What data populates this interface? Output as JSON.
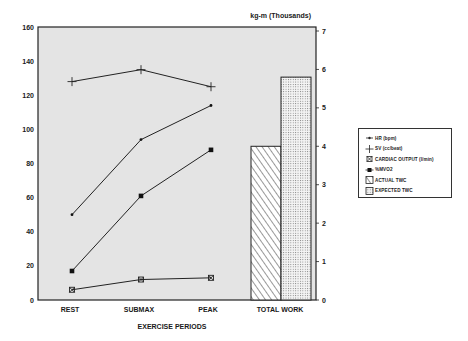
{
  "chart_data": {
    "type": "line",
    "title": "",
    "xlabel": "EXERCISE PERIODS",
    "ylabel": "",
    "y2label": "kg-m (Thousands)",
    "categories": [
      "REST",
      "SUBMAX",
      "PEAK"
    ],
    "ylim": [
      0,
      160
    ],
    "yticks": [
      0,
      20,
      40,
      60,
      80,
      100,
      120,
      140,
      160
    ],
    "y2lim": [
      0,
      7
    ],
    "y2ticks": [
      0,
      1,
      2,
      3,
      4,
      5,
      6,
      7
    ],
    "grid": false,
    "background": "#e4e4e4",
    "legend_position": "right",
    "series": [
      {
        "name": "HR (bpm)",
        "marker": "dot",
        "axis": "left",
        "values": [
          50,
          94,
          114
        ]
      },
      {
        "name": "SV (cc/beat)",
        "marker": "plus",
        "axis": "left",
        "values": [
          128,
          135,
          125
        ]
      },
      {
        "name": "CARDIAC OUTPUT (l/min)",
        "marker": "asterisk-box",
        "axis": "left",
        "values": [
          6,
          12,
          13
        ]
      },
      {
        "name": "%MVO2",
        "marker": "square",
        "axis": "left",
        "values": [
          17,
          61,
          88
        ]
      }
    ],
    "bars": {
      "category": "TOTAL WORK",
      "axis": "right",
      "series": [
        {
          "name": "ACTUAL TWC",
          "pattern": "diagonal-hatch",
          "value": 4.0
        },
        {
          "name": "EXPECTED TWC",
          "pattern": "dots",
          "value": 5.8
        }
      ]
    }
  },
  "axes": {
    "left_ticks": [
      "0",
      "20",
      "40",
      "60",
      "80",
      "100",
      "120",
      "140",
      "160"
    ],
    "right_ticks": [
      "0",
      "1",
      "2",
      "3",
      "4",
      "5",
      "6",
      "7"
    ],
    "right_title": "kg-m (Thousands)",
    "x_categories": [
      "REST",
      "SUBMAX",
      "PEAK",
      "TOTAL WORK"
    ],
    "x_title": "EXERCISE PERIODS"
  },
  "legend": {
    "items": [
      {
        "label": "HR (bpm)",
        "icon": "dot-line-icon"
      },
      {
        "label": "SV (cc/beat)",
        "icon": "plus-icon"
      },
      {
        "label": "CARDIAC OUTPUT (l/min)",
        "icon": "asterisk-icon"
      },
      {
        "label": "%MVO2",
        "icon": "filled-square-icon"
      },
      {
        "label": "ACTUAL TWC",
        "icon": "hatched-box-icon"
      },
      {
        "label": "EXPECTED TWC",
        "icon": "dotted-box-icon"
      }
    ]
  }
}
